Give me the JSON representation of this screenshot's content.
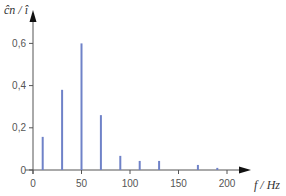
{
  "chart_data": {
    "type": "bar",
    "title": "",
    "xlabel": "f / Hz",
    "ylabel": "ĉn / î",
    "x": [
      10,
      30,
      50,
      70,
      90,
      110,
      130,
      170,
      190
    ],
    "values": [
      0.157,
      0.38,
      0.6,
      0.26,
      0.067,
      0.043,
      0.043,
      0.024,
      0.01
    ],
    "xlim": [
      0,
      240
    ],
    "ylim": [
      0,
      0.7
    ],
    "xticks": [
      0,
      50,
      100,
      150,
      200
    ],
    "xtick_labels": [
      "0",
      "50",
      "100",
      "150",
      "200"
    ],
    "yticks": [
      0,
      0.2,
      0.4,
      0.6
    ],
    "ytick_labels": [
      "0",
      "0,2",
      "0,4",
      "0,6"
    ],
    "grid": false,
    "legend": null,
    "bar_color": "#6f82c8",
    "axis_color": "#555555"
  }
}
